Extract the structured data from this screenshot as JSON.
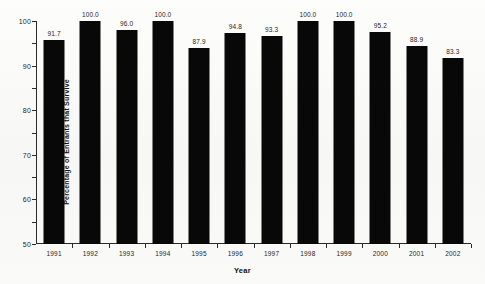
{
  "chart_data": {
    "type": "bar",
    "title": "",
    "xlabel": "Year",
    "ylabel": "Percentage of Entrants that Survive",
    "categories": [
      "1991",
      "1992",
      "1993",
      "1994",
      "1995",
      "1996",
      "1997",
      "1998",
      "1999",
      "2000",
      "2001",
      "2002"
    ],
    "values": [
      91.7,
      100.0,
      96.0,
      100.0,
      87.9,
      94.8,
      93.3,
      100.0,
      100.0,
      95.2,
      88.9,
      83.3
    ],
    "value_labels": [
      "91.7",
      "100.0",
      "96.0",
      "100.0",
      "87.9",
      "94.8",
      "93.3",
      "100.0",
      "100.0",
      "95.2",
      "88.9",
      "83.3"
    ],
    "ylim": [
      0,
      100
    ],
    "ytick_values": [
      0,
      10,
      20,
      30,
      40,
      50,
      60,
      70,
      80,
      90,
      100
    ],
    "ytick_labels": [
      "0",
      "10",
      "20",
      "30",
      "40",
      "50",
      "60",
      "70",
      "80",
      "90",
      "100"
    ],
    "grid": false,
    "legend": false,
    "bar_color": "#080808",
    "axis_color": "#2b2b2b",
    "background_color": "#fbfbfa",
    "text_color": "#1d1d1d"
  }
}
